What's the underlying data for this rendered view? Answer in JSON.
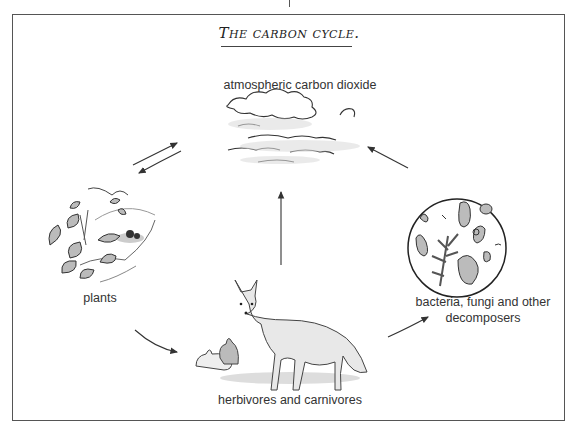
{
  "title": "The carbon cycle.",
  "nodes": {
    "atmosphere": {
      "label": "atmospheric carbon dioxide"
    },
    "plants": {
      "label": "plants"
    },
    "animals": {
      "label": "herbivores and carnivores"
    },
    "decomposers": {
      "label_line1": "bacteria, fungi and other",
      "label_line2": "decomposers"
    }
  },
  "edges": [
    {
      "from": "plants",
      "to": "atmosphere"
    },
    {
      "from": "atmosphere",
      "to": "plants"
    },
    {
      "from": "animals",
      "to": "atmosphere"
    },
    {
      "from": "decomposers",
      "to": "atmosphere"
    },
    {
      "from": "plants",
      "to": "animals"
    },
    {
      "from": "animals",
      "to": "decomposers"
    }
  ]
}
